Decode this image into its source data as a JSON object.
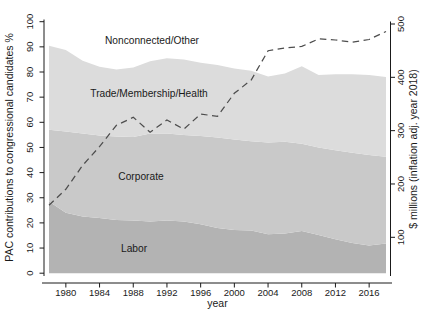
{
  "chart_data": {
    "type": "area",
    "stacked": true,
    "x_label": "year",
    "x": [
      1978,
      1980,
      1982,
      1984,
      1986,
      1988,
      1990,
      1992,
      1994,
      1996,
      1998,
      2000,
      2002,
      2004,
      2006,
      2008,
      2010,
      2012,
      2014,
      2016,
      2018
    ],
    "x_ticks": [
      1980,
      1984,
      1988,
      1992,
      1996,
      2000,
      2004,
      2008,
      2012,
      2016
    ],
    "y_left": {
      "label": "PAC contributions to congressional candidates %",
      "range": [
        0,
        100
      ],
      "ticks": [
        0,
        10,
        20,
        30,
        40,
        50,
        60,
        70,
        80,
        90,
        100
      ]
    },
    "y_right": {
      "label": "$ millions (inflation adj. year 2018)",
      "ticks": [
        100,
        200,
        300,
        400,
        500
      ]
    },
    "series": [
      {
        "name": "Labor",
        "axis": "left",
        "color": "#b3b3b3",
        "values": [
          28.5,
          24,
          22.5,
          22,
          21.2,
          21,
          20.5,
          21,
          20.5,
          19.5,
          18,
          17.2,
          17,
          15.5,
          15.8,
          16.8,
          15.2,
          13.5,
          12,
          11,
          11.8
        ]
      },
      {
        "name": "Corporate",
        "axis": "left",
        "color": "#c9c9c9",
        "values": [
          28.5,
          32.3,
          33.1,
          32.7,
          33.1,
          33.2,
          35,
          34.5,
          34.5,
          35,
          36,
          36,
          35.5,
          36.5,
          36.5,
          34.7,
          34.8,
          35.4,
          35.9,
          36,
          34.5
        ]
      },
      {
        "name": "Trade/Membership/Health",
        "axis": "left",
        "color": "#dcdcdc",
        "values": [
          33.4,
          32.4,
          28.9,
          27.4,
          26.7,
          27.6,
          28.8,
          30,
          30,
          29.2,
          28.8,
          28.2,
          28,
          26.2,
          27.1,
          30.8,
          28.8,
          30.2,
          31.2,
          31.8,
          31.7
        ]
      },
      {
        "name": "Nonconnected/Other",
        "axis": "left",
        "color": "#ffffff",
        "values": [
          9.6,
          11.3,
          15.5,
          17.9,
          19,
          18.2,
          15.7,
          14.5,
          15,
          16.3,
          17.2,
          18.6,
          19.5,
          21.8,
          20.6,
          17.7,
          21.2,
          20.9,
          20.9,
          21.2,
          22
        ]
      }
    ],
    "line_series": {
      "axis": "right",
      "style": "dashed",
      "color": "#4d4d4d",
      "values": [
        160,
        190,
        235,
        270,
        310,
        325,
        297,
        320,
        303,
        331,
        327,
        370,
        395,
        450,
        455,
        458,
        472,
        470,
        466,
        471,
        486
      ]
    }
  }
}
